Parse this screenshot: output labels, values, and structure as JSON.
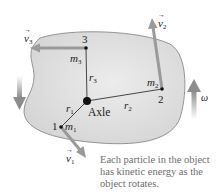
{
  "figure": {
    "axle_label": "Axle",
    "omega_label": "ω",
    "caption": {
      "lines": [
        "Each particle in the object",
        "has kinetic energy as the",
        "object rotates."
      ]
    },
    "particles": [
      {
        "number": "1",
        "mass_symbol": "m",
        "mass_sub": "1",
        "radius_symbol": "r",
        "radius_sub": "1",
        "velocity_symbol": "v",
        "velocity_sub": "1"
      },
      {
        "number": "2",
        "mass_symbol": "m",
        "mass_sub": "2",
        "radius_symbol": "r",
        "radius_sub": "2",
        "velocity_symbol": "v",
        "velocity_sub": "2"
      },
      {
        "number": "3",
        "mass_symbol": "m",
        "mass_sub": "3",
        "radius_symbol": "r",
        "radius_sub": "3",
        "velocity_symbol": "v",
        "velocity_sub": "3"
      }
    ],
    "colors": {
      "body_fill": "#dedede",
      "body_stroke": "#8a8a8a",
      "arrow": "#9a9a9a",
      "line": "#333333",
      "caption_text": "#6e6e6e"
    }
  }
}
